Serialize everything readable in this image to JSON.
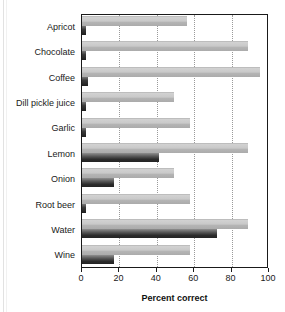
{
  "chart_data": {
    "type": "bar",
    "orientation": "horizontal",
    "title": "",
    "xlabel": "Percent correct",
    "ylabel": "",
    "xlim": [
      0,
      100
    ],
    "xticks": [
      0,
      20,
      40,
      60,
      80,
      100
    ],
    "xticklabels": [
      "0",
      "20",
      "40",
      "60",
      "80",
      "100"
    ],
    "grid": "vertical-dotted",
    "legend": "none",
    "categories": [
      "Apricot",
      "Chocolate",
      "Coffee",
      "Dill pickle juice",
      "Garlic",
      "Lemon",
      "Onion",
      "Root beer",
      "Water",
      "Wine"
    ],
    "series": [
      {
        "name": "light",
        "color": "#c4c4c4",
        "values": [
          56,
          89,
          95,
          49,
          58,
          89,
          49,
          58,
          89,
          58
        ]
      },
      {
        "name": "dark",
        "color": "#2c2c2c",
        "values": [
          2,
          2,
          3,
          2,
          2,
          41,
          17,
          2,
          72,
          17
        ]
      }
    ]
  },
  "axis": {
    "x_title": "Percent correct"
  }
}
